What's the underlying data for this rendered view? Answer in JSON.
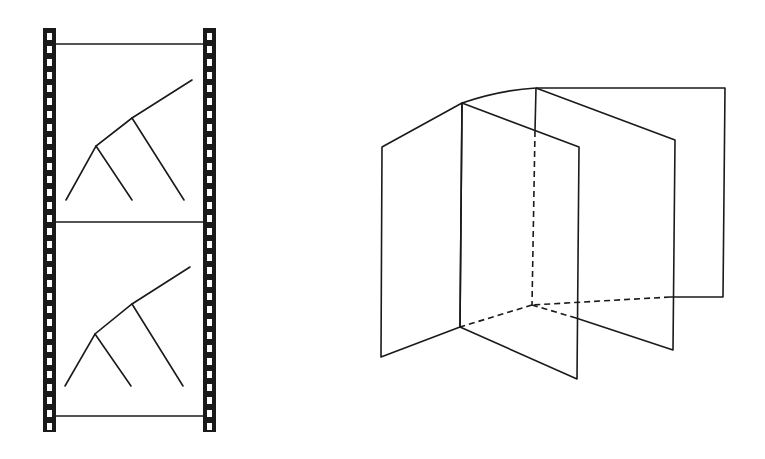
{
  "figure": {
    "colors": {
      "ink": "#1a1a1a",
      "background": "#ffffff"
    }
  },
  "film_strip": {
    "frames": 2,
    "frame_content": "branching-tree-line-drawing"
  },
  "folded_panels": {
    "panels": 4,
    "hidden_edges": "dashed"
  }
}
